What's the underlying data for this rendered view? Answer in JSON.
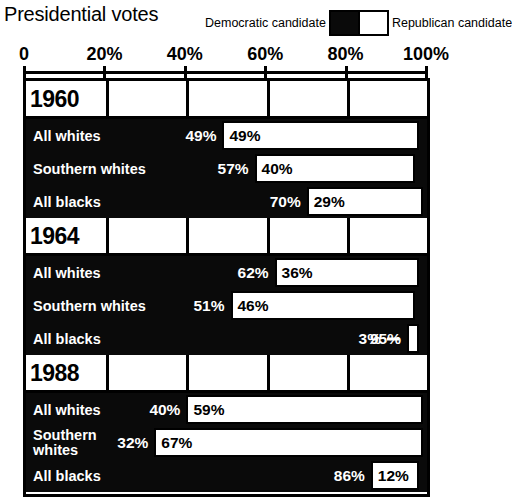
{
  "header": {
    "title": "Presidential votes",
    "legend": {
      "democratic_label": "Democratic\ncandidate",
      "republican_label": "Republican\ncandidate",
      "democratic_color": "#0a0a0a",
      "republican_color": "#ffffff"
    }
  },
  "axis": {
    "ticks": [
      "0",
      "20%",
      "40%",
      "60%",
      "80%",
      "100%"
    ],
    "tick_values": [
      0,
      20,
      40,
      60,
      80,
      100
    ],
    "min": 0,
    "max": 100
  },
  "chart_data": {
    "type": "bar",
    "title": "Presidential votes",
    "xlabel": "",
    "ylabel": "",
    "xlim": [
      0,
      100
    ],
    "grid": true,
    "legend_position": "top-right",
    "orientation": "horizontal",
    "stacked": true,
    "series": [
      {
        "name": "Democratic candidate",
        "color": "#0a0a0a"
      },
      {
        "name": "Republican candidate",
        "color": "#ffffff"
      }
    ],
    "groups": [
      {
        "year": "1960",
        "rows": [
          {
            "category": "All whites",
            "democratic": 49,
            "republican": 49,
            "dem_label": "49%",
            "rep_label": "49%"
          },
          {
            "category": "Southern whites",
            "democratic": 57,
            "republican": 40,
            "dem_label": "57%",
            "rep_label": "40%"
          },
          {
            "category": "All blacks",
            "democratic": 70,
            "republican": 29,
            "dem_label": "70%",
            "rep_label": "29%"
          }
        ]
      },
      {
        "year": "1964",
        "rows": [
          {
            "category": "All whites",
            "democratic": 62,
            "republican": 36,
            "dem_label": "62%",
            "rep_label": "36%"
          },
          {
            "category": "Southern whites",
            "democratic": 51,
            "republican": 46,
            "dem_label": "51%",
            "rep_label": "46%"
          },
          {
            "category": "All blacks",
            "democratic": 95,
            "republican": 3,
            "dem_label": "95%",
            "rep_label": "3%"
          }
        ]
      },
      {
        "year": "1988",
        "rows": [
          {
            "category": "All whites",
            "democratic": 40,
            "republican": 59,
            "dem_label": "40%",
            "rep_label": "59%"
          },
          {
            "category": "Southern\nwhites",
            "democratic": 32,
            "republican": 67,
            "dem_label": "32%",
            "rep_label": "67%"
          },
          {
            "category": "All blacks",
            "democratic": 86,
            "republican": 12,
            "dem_label": "86%",
            "rep_label": "12%"
          }
        ]
      }
    ]
  }
}
